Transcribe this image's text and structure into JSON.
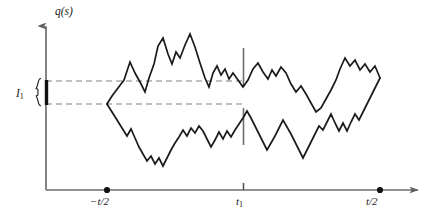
{
  "figure": {
    "type": "line-plot",
    "background": "#ffffff",
    "ink_color": "#1a1a1a",
    "axis_color": "#6e6e6e",
    "dash_color": "#808080",
    "y_axis_label": "q(s)",
    "interval_label": "I",
    "interval_label_sub": "1",
    "x_tick_labels": [
      {
        "name": "minus-t-over-2",
        "text": "−t/2",
        "marker": "dot",
        "x": 107
      },
      {
        "name": "t-sub-1",
        "text": "t",
        "sub": "1",
        "marker": "tick",
        "x": 243
      },
      {
        "name": "t-over-2",
        "text": "t/2",
        "marker": "dot",
        "x": 380
      }
    ],
    "guides": {
      "upper_dashed_y": 81,
      "lower_dashed_y": 104,
      "dashed_x_start": 46,
      "dashed_x_end": 244,
      "interval_bar_x": 46,
      "interval_bar_y_top": 80,
      "interval_bar_y_bottom": 105,
      "t1_tick_x": 243,
      "t1_tick_upper": [
        48,
        85
      ],
      "t1_tick_lower": [
        108,
        145
      ]
    },
    "axes": {
      "origin_x": 46,
      "baseline_y": 190,
      "y_top": 20,
      "x_right": 425
    }
  },
  "chart_data": {
    "type": "line",
    "title": "",
    "subtitle": "",
    "xlabel": "",
    "ylabel": "q(s)",
    "xlim": [
      46,
      425
    ],
    "ylim": [
      190,
      20
    ],
    "grid": false,
    "legend": null,
    "annotations": [
      {
        "name": "interval-brace",
        "text": "I₁",
        "x": 30,
        "y": 92
      },
      {
        "name": "axis-arrow-y",
        "x": 46,
        "y": 20
      },
      {
        "name": "axis-arrow-x",
        "x": 425,
        "y": 190
      }
    ],
    "xticks": [
      107,
      243,
      380
    ],
    "xticklabels": [
      "−t/2",
      "t₁",
      "t/2"
    ],
    "series": [
      {
        "name": "upper-path",
        "color": "#1a1a1a",
        "points": [
          [
            107,
            104
          ],
          [
            112,
            96
          ],
          [
            118,
            88
          ],
          [
            124,
            80
          ],
          [
            130,
            62
          ],
          [
            135,
            73
          ],
          [
            140,
            82
          ],
          [
            145,
            92
          ],
          [
            149,
            78
          ],
          [
            154,
            64
          ],
          [
            158,
            46
          ],
          [
            163,
            38
          ],
          [
            168,
            54
          ],
          [
            172,
            64
          ],
          [
            176,
            52
          ],
          [
            180,
            58
          ],
          [
            185,
            45
          ],
          [
            190,
            34
          ],
          [
            195,
            47
          ],
          [
            200,
            63
          ],
          [
            205,
            78
          ],
          [
            209,
            87
          ],
          [
            213,
            73
          ],
          [
            217,
            66
          ],
          [
            221,
            75
          ],
          [
            225,
            69
          ],
          [
            229,
            79
          ],
          [
            233,
            73
          ],
          [
            238,
            80
          ],
          [
            243,
            87
          ],
          [
            248,
            80
          ],
          [
            253,
            69
          ],
          [
            258,
            63
          ],
          [
            263,
            72
          ],
          [
            268,
            79
          ],
          [
            272,
            70
          ],
          [
            276,
            76
          ],
          [
            281,
            67
          ],
          [
            286,
            73
          ],
          [
            291,
            84
          ],
          [
            296,
            92
          ],
          [
            301,
            86
          ],
          [
            306,
            94
          ],
          [
            311,
            103
          ],
          [
            316,
            112
          ],
          [
            321,
            108
          ],
          [
            326,
            99
          ],
          [
            331,
            90
          ],
          [
            336,
            80
          ],
          [
            340,
            69
          ],
          [
            345,
            58
          ],
          [
            350,
            66
          ],
          [
            355,
            60
          ],
          [
            360,
            70
          ],
          [
            365,
            64
          ],
          [
            370,
            72
          ],
          [
            375,
            66
          ],
          [
            380,
            78
          ]
        ]
      },
      {
        "name": "lower-path",
        "color": "#1a1a1a",
        "points": [
          [
            107,
            104
          ],
          [
            112,
            112
          ],
          [
            117,
            120
          ],
          [
            122,
            128
          ],
          [
            127,
            136
          ],
          [
            131,
            129
          ],
          [
            135,
            138
          ],
          [
            139,
            147
          ],
          [
            143,
            154
          ],
          [
            147,
            161
          ],
          [
            151,
            156
          ],
          [
            155,
            164
          ],
          [
            159,
            158
          ],
          [
            163,
            166
          ],
          [
            167,
            158
          ],
          [
            171,
            150
          ],
          [
            175,
            143
          ],
          [
            179,
            137
          ],
          [
            183,
            130
          ],
          [
            187,
            136
          ],
          [
            191,
            128
          ],
          [
            195,
            133
          ],
          [
            199,
            126
          ],
          [
            203,
            131
          ],
          [
            207,
            139
          ],
          [
            211,
            147
          ],
          [
            215,
            140
          ],
          [
            219,
            132
          ],
          [
            223,
            139
          ],
          [
            227,
            131
          ],
          [
            231,
            137
          ],
          [
            235,
            130
          ],
          [
            239,
            124
          ],
          [
            243,
            118
          ],
          [
            247,
            111
          ],
          [
            251,
            118
          ],
          [
            255,
            126
          ],
          [
            259,
            134
          ],
          [
            263,
            142
          ],
          [
            267,
            150
          ],
          [
            271,
            143
          ],
          [
            275,
            136
          ],
          [
            279,
            128
          ],
          [
            283,
            120
          ],
          [
            287,
            127
          ],
          [
            291,
            134
          ],
          [
            295,
            142
          ],
          [
            299,
            150
          ],
          [
            303,
            158
          ],
          [
            307,
            150
          ],
          [
            311,
            142
          ],
          [
            315,
            134
          ],
          [
            319,
            126
          ],
          [
            323,
            130
          ],
          [
            327,
            122
          ],
          [
            331,
            114
          ],
          [
            335,
            123
          ],
          [
            339,
            131
          ],
          [
            343,
            123
          ],
          [
            347,
            131
          ],
          [
            351,
            122
          ],
          [
            355,
            114
          ],
          [
            359,
            120
          ],
          [
            363,
            112
          ],
          [
            367,
            104
          ],
          [
            371,
            96
          ],
          [
            375,
            88
          ],
          [
            380,
            78
          ]
        ]
      }
    ]
  }
}
